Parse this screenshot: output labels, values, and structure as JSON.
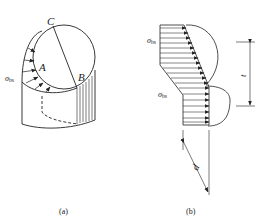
{
  "figure": {
    "panel_a": {
      "caption": "(a)",
      "points": {
        "C": "C",
        "A": "A",
        "B": "B"
      },
      "stress_label": "σ",
      "stress_subscript": "bs"
    },
    "panel_b": {
      "caption": "(b)",
      "stress_label_top": "σ",
      "stress_subscript_top": "bs",
      "stress_label_bottom": "σ",
      "stress_subscript_bottom": "bs",
      "dimension_label": "t",
      "diameter_label": "d"
    },
    "colors": {
      "line": "#222222",
      "background": "#ffffff"
    }
  }
}
